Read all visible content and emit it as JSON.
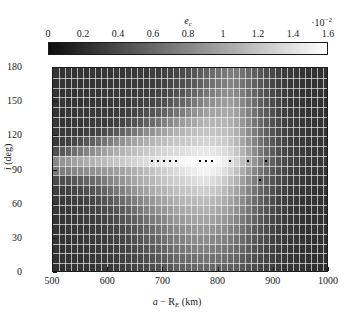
{
  "figure": {
    "type": "heatmap",
    "colorbar": {
      "label": "e",
      "label_sub": "c",
      "exponent_prefix": "·10",
      "exponent_sup": "−2",
      "ticks": [
        "0",
        "0.2",
        "0.4",
        "0.6",
        "0.8",
        "1",
        "1.2",
        "1.4",
        "1.6"
      ],
      "tick_values": [
        0,
        0.2,
        0.4,
        0.6,
        0.8,
        1.0,
        1.2,
        1.4,
        1.6
      ],
      "vmin": 0,
      "vmax": 1.6,
      "colormap": "grayscale-black-to-white",
      "color_low": "#0d0d0d",
      "color_high": "#ffffff"
    },
    "x_axis": {
      "label_main": "a",
      "label_dash": "− R",
      "label_sub": "E",
      "label_unit": "(km)",
      "ticks": [
        "500",
        "600",
        "700",
        "800",
        "900",
        "1000"
      ],
      "tick_values": [
        500,
        600,
        700,
        800,
        900,
        1000
      ],
      "min": 500,
      "max": 1000
    },
    "y_axis": {
      "label_main": "i",
      "label_unit": "(deg)",
      "ticks": [
        "0",
        "30",
        "60",
        "90",
        "120",
        "150",
        "180"
      ],
      "tick_values": [
        0,
        30,
        60,
        90,
        120,
        150,
        180
      ],
      "min": 0,
      "max": 180
    }
  },
  "chart_data": {
    "type": "heatmap",
    "title": "",
    "xlabel": "a − R_E (km)",
    "ylabel": "i (deg)",
    "zlabel": "e_c ·10⁻²",
    "xlim": [
      500,
      1000
    ],
    "ylim": [
      0,
      180
    ],
    "zlim": [
      0,
      1.6
    ],
    "colormap": "gray",
    "grid": true,
    "n_cols": 46,
    "n_rows": 21,
    "x_edges_note": "46 uniform bins from 500 to 1000 km",
    "y_edges_note": "21 uniform bins from 0 to 180 deg",
    "x_centers": [
      505.4,
      516.3,
      527.2,
      538.0,
      548.9,
      559.8,
      570.7,
      581.5,
      592.4,
      603.3,
      614.1,
      625.0,
      635.9,
      646.7,
      657.6,
      668.5,
      679.3,
      690.2,
      701.1,
      712.0,
      722.8,
      733.7,
      744.6,
      755.4,
      766.3,
      777.2,
      788.0,
      798.9,
      809.8,
      820.7,
      831.5,
      842.4,
      853.3,
      864.1,
      875.0,
      885.9,
      896.7,
      907.6,
      918.5,
      929.3,
      940.2,
      951.1,
      962.0,
      972.8,
      983.7,
      994.6
    ],
    "y_centers": [
      4.3,
      12.9,
      21.4,
      30.0,
      38.6,
      47.1,
      55.7,
      64.3,
      72.9,
      81.4,
      90.0,
      98.6,
      107.1,
      115.7,
      124.3,
      132.9,
      141.4,
      150.0,
      158.6,
      167.1,
      175.7
    ],
    "values": [
      [
        0.26,
        0.25,
        0.27,
        0.24,
        0.26,
        0.25,
        0.27,
        0.26,
        0.28,
        0.26,
        0.29,
        0.27,
        0.3,
        0.28,
        0.31,
        0.29,
        0.33,
        0.31,
        0.35,
        0.36,
        0.38,
        0.4,
        0.44,
        0.48,
        0.52,
        0.56,
        0.62,
        0.66,
        0.7,
        0.74,
        0.72,
        0.66,
        0.6,
        0.54,
        0.48,
        0.42,
        0.38,
        0.34,
        0.31,
        0.29,
        0.27,
        0.26,
        0.25,
        0.24,
        0.24,
        0.23
      ],
      [
        0.25,
        0.26,
        0.25,
        0.27,
        0.25,
        0.26,
        0.26,
        0.27,
        0.26,
        0.28,
        0.27,
        0.29,
        0.28,
        0.3,
        0.29,
        0.31,
        0.31,
        0.33,
        0.36,
        0.37,
        0.4,
        0.43,
        0.47,
        0.51,
        0.55,
        0.6,
        0.66,
        0.7,
        0.74,
        0.78,
        0.75,
        0.68,
        0.62,
        0.55,
        0.49,
        0.43,
        0.38,
        0.34,
        0.31,
        0.28,
        0.27,
        0.26,
        0.25,
        0.24,
        0.23,
        0.23
      ],
      [
        0.26,
        0.25,
        0.26,
        0.25,
        0.27,
        0.26,
        0.28,
        0.27,
        0.29,
        0.28,
        0.3,
        0.29,
        0.31,
        0.3,
        0.32,
        0.32,
        0.34,
        0.36,
        0.39,
        0.41,
        0.45,
        0.49,
        0.54,
        0.59,
        0.64,
        0.7,
        0.76,
        0.8,
        0.84,
        0.86,
        0.82,
        0.74,
        0.66,
        0.58,
        0.51,
        0.45,
        0.39,
        0.35,
        0.32,
        0.29,
        0.27,
        0.26,
        0.25,
        0.25,
        0.24,
        0.23
      ],
      [
        0.25,
        0.27,
        0.26,
        0.28,
        0.26,
        0.28,
        0.27,
        0.29,
        0.28,
        0.3,
        0.29,
        0.31,
        0.3,
        0.33,
        0.34,
        0.36,
        0.38,
        0.41,
        0.45,
        0.49,
        0.54,
        0.59,
        0.65,
        0.71,
        0.77,
        0.83,
        0.88,
        0.92,
        0.94,
        0.95,
        0.9,
        0.81,
        0.72,
        0.63,
        0.55,
        0.48,
        0.42,
        0.37,
        0.33,
        0.3,
        0.28,
        0.27,
        0.26,
        0.25,
        0.24,
        0.24
      ],
      [
        0.26,
        0.26,
        0.28,
        0.27,
        0.29,
        0.28,
        0.3,
        0.29,
        0.31,
        0.3,
        0.32,
        0.32,
        0.34,
        0.37,
        0.4,
        0.43,
        0.47,
        0.52,
        0.57,
        0.63,
        0.69,
        0.75,
        0.81,
        0.87,
        0.92,
        0.97,
        1.0,
        1.02,
        1.03,
        1.02,
        0.97,
        0.87,
        0.77,
        0.67,
        0.58,
        0.5,
        0.44,
        0.38,
        0.34,
        0.31,
        0.29,
        0.27,
        0.26,
        0.26,
        0.25,
        0.24
      ],
      [
        0.27,
        0.28,
        0.27,
        0.29,
        0.28,
        0.3,
        0.3,
        0.32,
        0.31,
        0.33,
        0.35,
        0.38,
        0.42,
        0.46,
        0.51,
        0.57,
        0.63,
        0.69,
        0.76,
        0.82,
        0.88,
        0.94,
        0.99,
        1.04,
        1.08,
        1.11,
        1.12,
        1.12,
        1.11,
        1.08,
        1.02,
        0.92,
        0.81,
        0.7,
        0.61,
        0.52,
        0.45,
        0.4,
        0.35,
        0.32,
        0.3,
        0.28,
        0.27,
        0.26,
        0.26,
        0.25
      ],
      [
        0.28,
        0.29,
        0.3,
        0.31,
        0.3,
        0.33,
        0.34,
        0.37,
        0.41,
        0.46,
        0.51,
        0.57,
        0.63,
        0.7,
        0.77,
        0.83,
        0.89,
        0.95,
        1.0,
        1.05,
        1.09,
        1.12,
        1.15,
        1.18,
        1.2,
        1.21,
        1.21,
        1.2,
        1.18,
        1.14,
        1.07,
        0.96,
        0.85,
        0.73,
        0.63,
        0.54,
        0.47,
        0.41,
        0.36,
        0.33,
        0.3,
        0.29,
        0.28,
        0.27,
        0.26,
        0.25
      ],
      [
        0.3,
        0.32,
        0.35,
        0.38,
        0.43,
        0.48,
        0.54,
        0.61,
        0.68,
        0.75,
        0.82,
        0.88,
        0.94,
        0.99,
        1.04,
        1.08,
        1.12,
        1.15,
        1.18,
        1.21,
        1.23,
        1.25,
        1.27,
        1.29,
        1.31,
        1.32,
        1.31,
        1.29,
        1.26,
        1.21,
        1.13,
        1.02,
        0.9,
        0.78,
        0.67,
        0.57,
        0.49,
        0.43,
        0.38,
        0.34,
        0.31,
        0.3,
        0.28,
        0.27,
        0.27,
        0.26
      ],
      [
        0.44,
        0.5,
        0.57,
        0.64,
        0.71,
        0.78,
        0.85,
        0.91,
        0.97,
        1.02,
        1.07,
        1.11,
        1.15,
        1.18,
        1.21,
        1.24,
        1.27,
        1.3,
        1.33,
        1.35,
        1.37,
        1.39,
        1.41,
        1.43,
        1.45,
        1.45,
        1.44,
        1.41,
        1.37,
        1.31,
        1.22,
        1.1,
        0.97,
        0.84,
        0.72,
        0.61,
        0.52,
        0.45,
        0.39,
        0.35,
        0.33,
        0.31,
        0.29,
        0.28,
        0.27,
        0.26
      ],
      [
        0.82,
        0.88,
        0.93,
        0.98,
        1.02,
        1.06,
        1.1,
        1.13,
        1.16,
        1.19,
        1.22,
        1.25,
        1.28,
        1.31,
        1.34,
        1.37,
        1.4,
        1.43,
        1.46,
        1.49,
        1.52,
        1.54,
        1.56,
        1.58,
        1.6,
        1.6,
        1.58,
        1.54,
        1.48,
        1.4,
        1.3,
        1.17,
        1.03,
        0.89,
        0.76,
        0.64,
        0.55,
        0.47,
        0.41,
        0.37,
        0.34,
        0.32,
        0.3,
        0.29,
        0.28,
        0.27
      ],
      [
        0.7,
        0.74,
        0.77,
        0.8,
        0.82,
        0.85,
        0.87,
        0.89,
        0.92,
        0.94,
        0.97,
        1.0,
        1.04,
        1.08,
        1.12,
        1.16,
        1.2,
        1.24,
        1.28,
        1.32,
        1.36,
        1.4,
        1.44,
        1.48,
        1.52,
        1.53,
        1.5,
        1.45,
        1.38,
        1.29,
        1.19,
        1.06,
        0.93,
        0.8,
        0.69,
        0.59,
        0.5,
        0.44,
        0.39,
        0.35,
        0.32,
        0.3,
        0.29,
        0.28,
        0.27,
        0.26
      ],
      [
        0.4,
        0.42,
        0.45,
        0.48,
        0.52,
        0.56,
        0.61,
        0.66,
        0.72,
        0.78,
        0.84,
        0.9,
        0.95,
        1.0,
        1.05,
        1.09,
        1.13,
        1.17,
        1.21,
        1.25,
        1.28,
        1.31,
        1.34,
        1.37,
        1.4,
        1.4,
        1.37,
        1.32,
        1.26,
        1.18,
        1.09,
        0.97,
        0.86,
        0.74,
        0.64,
        0.55,
        0.47,
        0.41,
        0.37,
        0.33,
        0.31,
        0.29,
        0.28,
        0.27,
        0.26,
        0.25
      ],
      [
        0.32,
        0.33,
        0.35,
        0.37,
        0.4,
        0.43,
        0.47,
        0.52,
        0.58,
        0.64,
        0.7,
        0.77,
        0.83,
        0.89,
        0.95,
        1.0,
        1.05,
        1.09,
        1.12,
        1.15,
        1.18,
        1.21,
        1.23,
        1.25,
        1.27,
        1.27,
        1.25,
        1.21,
        1.15,
        1.08,
        1.0,
        0.9,
        0.79,
        0.69,
        0.59,
        0.51,
        0.44,
        0.39,
        0.35,
        0.32,
        0.3,
        0.28,
        0.27,
        0.26,
        0.25,
        0.25
      ],
      [
        0.29,
        0.3,
        0.31,
        0.32,
        0.34,
        0.36,
        0.39,
        0.42,
        0.46,
        0.51,
        0.56,
        0.62,
        0.68,
        0.74,
        0.8,
        0.86,
        0.92,
        0.97,
        1.01,
        1.05,
        1.08,
        1.11,
        1.13,
        1.15,
        1.16,
        1.16,
        1.14,
        1.11,
        1.06,
        1.0,
        0.93,
        0.84,
        0.74,
        0.64,
        0.56,
        0.48,
        0.42,
        0.37,
        0.34,
        0.31,
        0.29,
        0.27,
        0.26,
        0.26,
        0.25,
        0.24
      ],
      [
        0.27,
        0.28,
        0.29,
        0.3,
        0.31,
        0.33,
        0.35,
        0.37,
        0.4,
        0.44,
        0.48,
        0.53,
        0.58,
        0.64,
        0.7,
        0.76,
        0.82,
        0.87,
        0.92,
        0.96,
        1.0,
        1.03,
        1.05,
        1.07,
        1.08,
        1.08,
        1.06,
        1.03,
        0.99,
        0.94,
        0.87,
        0.79,
        0.7,
        0.61,
        0.53,
        0.46,
        0.4,
        0.36,
        0.33,
        0.3,
        0.28,
        0.27,
        0.26,
        0.25,
        0.25,
        0.24
      ],
      [
        0.26,
        0.27,
        0.28,
        0.28,
        0.3,
        0.31,
        0.32,
        0.34,
        0.36,
        0.39,
        0.42,
        0.46,
        0.5,
        0.55,
        0.6,
        0.66,
        0.72,
        0.77,
        0.82,
        0.87,
        0.91,
        0.94,
        0.97,
        0.99,
        1.0,
        1.0,
        0.98,
        0.95,
        0.91,
        0.86,
        0.8,
        0.73,
        0.65,
        0.57,
        0.5,
        0.44,
        0.39,
        0.35,
        0.32,
        0.29,
        0.28,
        0.26,
        0.26,
        0.25,
        0.24,
        0.24
      ],
      [
        0.26,
        0.26,
        0.27,
        0.28,
        0.29,
        0.3,
        0.31,
        0.32,
        0.34,
        0.36,
        0.38,
        0.41,
        0.45,
        0.49,
        0.53,
        0.58,
        0.63,
        0.68,
        0.73,
        0.78,
        0.82,
        0.86,
        0.89,
        0.91,
        0.92,
        0.92,
        0.9,
        0.87,
        0.84,
        0.79,
        0.74,
        0.67,
        0.6,
        0.53,
        0.47,
        0.42,
        0.37,
        0.34,
        0.31,
        0.29,
        0.27,
        0.26,
        0.25,
        0.25,
        0.24,
        0.23
      ],
      [
        0.25,
        0.26,
        0.26,
        0.27,
        0.28,
        0.29,
        0.3,
        0.31,
        0.32,
        0.34,
        0.36,
        0.38,
        0.41,
        0.44,
        0.48,
        0.52,
        0.56,
        0.61,
        0.66,
        0.7,
        0.74,
        0.78,
        0.81,
        0.83,
        0.84,
        0.84,
        0.82,
        0.8,
        0.77,
        0.73,
        0.68,
        0.62,
        0.56,
        0.5,
        0.45,
        0.4,
        0.36,
        0.33,
        0.3,
        0.28,
        0.27,
        0.26,
        0.25,
        0.24,
        0.24,
        0.23
      ],
      [
        0.25,
        0.25,
        0.26,
        0.27,
        0.27,
        0.28,
        0.29,
        0.3,
        0.31,
        0.32,
        0.34,
        0.36,
        0.38,
        0.41,
        0.44,
        0.47,
        0.51,
        0.55,
        0.59,
        0.63,
        0.67,
        0.7,
        0.73,
        0.75,
        0.76,
        0.76,
        0.75,
        0.73,
        0.7,
        0.67,
        0.63,
        0.58,
        0.53,
        0.47,
        0.43,
        0.38,
        0.35,
        0.32,
        0.3,
        0.28,
        0.26,
        0.25,
        0.25,
        0.24,
        0.23,
        0.23
      ],
      [
        0.24,
        0.25,
        0.25,
        0.26,
        0.26,
        0.27,
        0.28,
        0.29,
        0.3,
        0.31,
        0.32,
        0.34,
        0.36,
        0.38,
        0.4,
        0.43,
        0.46,
        0.5,
        0.53,
        0.57,
        0.6,
        0.63,
        0.65,
        0.67,
        0.68,
        0.68,
        0.67,
        0.66,
        0.64,
        0.61,
        0.58,
        0.53,
        0.49,
        0.45,
        0.41,
        0.37,
        0.34,
        0.31,
        0.29,
        0.27,
        0.26,
        0.25,
        0.24,
        0.24,
        0.23,
        0.23
      ],
      [
        0.24,
        0.24,
        0.25,
        0.25,
        0.26,
        0.26,
        0.27,
        0.28,
        0.29,
        0.3,
        0.31,
        0.32,
        0.34,
        0.36,
        0.38,
        0.4,
        0.42,
        0.45,
        0.48,
        0.51,
        0.54,
        0.56,
        0.58,
        0.6,
        0.6,
        0.6,
        0.6,
        0.58,
        0.57,
        0.55,
        0.52,
        0.49,
        0.45,
        0.42,
        0.38,
        0.35,
        0.33,
        0.3,
        0.28,
        0.27,
        0.26,
        0.25,
        0.24,
        0.23,
        0.23,
        0.22
      ]
    ],
    "markers": {
      "name": "critical-eccentricity-markers",
      "style": "black-square-dot",
      "y_value": 98.6,
      "x_values": [
        679,
        690,
        701,
        712,
        723,
        766,
        777,
        788,
        820,
        853,
        886
      ]
    },
    "marker_extra": {
      "x": 875,
      "y": 81.4
    }
  }
}
